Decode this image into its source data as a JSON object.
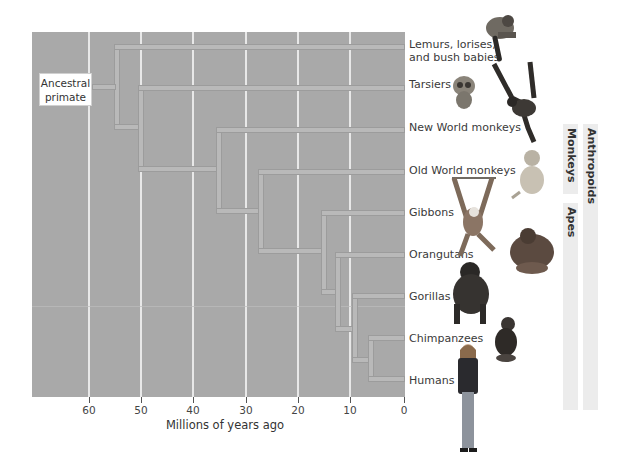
{
  "diagram": {
    "root_label": "Ancestral primate",
    "axis": {
      "label": "Millions of years ago",
      "ticks": [
        "60",
        "50",
        "40",
        "30",
        "20",
        "10",
        "0"
      ]
    },
    "taxa": [
      {
        "name": "Lemurs, lorises,",
        "name_line2": "and bush babies"
      },
      {
        "name": "Tarsiers"
      },
      {
        "name": "New World monkeys"
      },
      {
        "name": "Old World monkeys"
      },
      {
        "name": "Gibbons"
      },
      {
        "name": "Orangutans"
      },
      {
        "name": "Gorillas"
      },
      {
        "name": "Chimpanzees"
      },
      {
        "name": "Humans"
      }
    ],
    "groups": {
      "monkeys": "Monkeys",
      "apes": "Apes",
      "anthropoids": "Anthropoids"
    },
    "divergences_mya": {
      "lemurs_vs_rest": 55,
      "tarsiers_vs_anthropoids": 50,
      "new_world_vs_old_world_and_apes": 35,
      "old_world_monkeys_vs_apes": 28,
      "gibbons_vs_great_apes": 16,
      "orangutans_vs_african_apes": 13,
      "gorillas_vs_chimps_humans": 9,
      "chimps_vs_humans": 6
    },
    "colors": {
      "panel": "#a9a9a9",
      "branch": "#b9b9b9",
      "gridline": "#e8e8e8",
      "group_bar": "#ececec"
    }
  }
}
